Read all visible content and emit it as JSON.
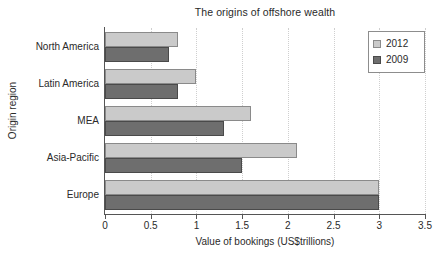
{
  "chart_data": {
    "type": "bar",
    "orientation": "horizontal",
    "title": "The origins of offshore wealth",
    "xlabel": "Value of bookings (US$trillions)",
    "ylabel": "Origin region",
    "categories": [
      "North America",
      "Latin America",
      "MEA",
      "Asia-Pacific",
      "Europe"
    ],
    "series": [
      {
        "name": "2012",
        "color": "#cacaca",
        "values": [
          0.8,
          1.0,
          1.6,
          2.1,
          3.0
        ]
      },
      {
        "name": "2009",
        "color": "#6e6e6e",
        "values": [
          0.7,
          0.8,
          1.3,
          1.5,
          3.0
        ]
      }
    ],
    "xlim": [
      0,
      3.5
    ],
    "xticks": [
      "0",
      "0.5",
      "1",
      "1.5",
      "2",
      "2.5",
      "3",
      "3.5"
    ],
    "xtick_values": [
      0,
      0.5,
      1,
      1.5,
      2,
      2.5,
      3,
      3.5
    ],
    "grid": "vertical-dotted",
    "legend_position": "top-right",
    "legend_entries": [
      "2012",
      "2009"
    ]
  }
}
